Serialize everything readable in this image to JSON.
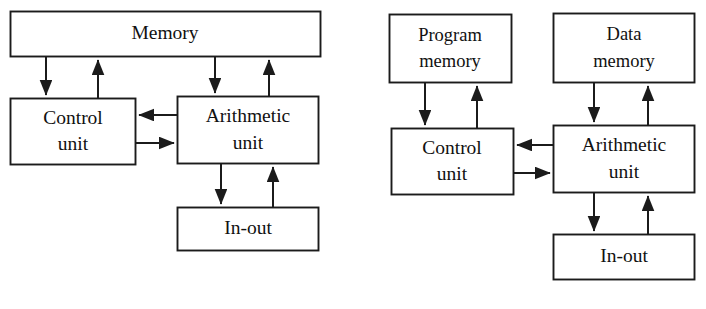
{
  "figure": {
    "background_color": "#ffffff",
    "line_color": "#1b1b1b",
    "text_color": "#111111",
    "width": 706,
    "height": 309
  },
  "diagrams": [
    {
      "id": "von-neumann",
      "name": "Von Neumann architecture (single memory)",
      "boxes": [
        {
          "id": "memory",
          "label": "Memory",
          "lines": [
            "Memory"
          ]
        },
        {
          "id": "control-unit",
          "label": "Control unit",
          "lines": [
            "Control",
            "unit"
          ]
        },
        {
          "id": "arithmetic-unit",
          "label": "Arithmetic unit",
          "lines": [
            "Arithmetic",
            "unit"
          ]
        },
        {
          "id": "in-out",
          "label": "In-out",
          "lines": [
            "In-out"
          ]
        }
      ],
      "connections": [
        {
          "from": "memory",
          "to": "control-unit",
          "direction": "down"
        },
        {
          "from": "control-unit",
          "to": "memory",
          "direction": "up"
        },
        {
          "from": "memory",
          "to": "arithmetic-unit",
          "direction": "down"
        },
        {
          "from": "arithmetic-unit",
          "to": "memory",
          "direction": "up"
        },
        {
          "from": "arithmetic-unit",
          "to": "control-unit",
          "direction": "left"
        },
        {
          "from": "control-unit",
          "to": "arithmetic-unit",
          "direction": "right"
        },
        {
          "from": "arithmetic-unit",
          "to": "in-out",
          "direction": "down"
        },
        {
          "from": "in-out",
          "to": "arithmetic-unit",
          "direction": "up"
        }
      ]
    },
    {
      "id": "harvard",
      "name": "Harvard architecture (separate program and data memory)",
      "boxes": [
        {
          "id": "program-memory",
          "label": "Program memory",
          "lines": [
            "Program",
            "memory"
          ]
        },
        {
          "id": "data-memory",
          "label": "Data memory",
          "lines": [
            "Data",
            "memory"
          ]
        },
        {
          "id": "control-unit",
          "label": "Control unit",
          "lines": [
            "Control",
            "unit"
          ]
        },
        {
          "id": "arithmetic-unit",
          "label": "Arithmetic unit",
          "lines": [
            "Arithmetic",
            "unit"
          ]
        },
        {
          "id": "in-out",
          "label": "In-out",
          "lines": [
            "In-out"
          ]
        }
      ],
      "connections": [
        {
          "from": "program-memory",
          "to": "control-unit",
          "direction": "down"
        },
        {
          "from": "control-unit",
          "to": "program-memory",
          "direction": "up"
        },
        {
          "from": "data-memory",
          "to": "arithmetic-unit",
          "direction": "down"
        },
        {
          "from": "arithmetic-unit",
          "to": "data-memory",
          "direction": "up"
        },
        {
          "from": "arithmetic-unit",
          "to": "control-unit",
          "direction": "left"
        },
        {
          "from": "control-unit",
          "to": "arithmetic-unit",
          "direction": "right"
        },
        {
          "from": "arithmetic-unit",
          "to": "in-out",
          "direction": "down"
        },
        {
          "from": "in-out",
          "to": "arithmetic-unit",
          "direction": "up"
        }
      ]
    }
  ],
  "labels": {
    "memory": "Memory",
    "program_line1": "Program",
    "program_line2": "memory",
    "data_line1": "Data",
    "data_line2": "memory",
    "control_line1": "Control",
    "control_line2": "unit",
    "arithmetic_line1": "Arithmetic",
    "arithmetic_line2": "unit",
    "in_out": "In-out"
  }
}
